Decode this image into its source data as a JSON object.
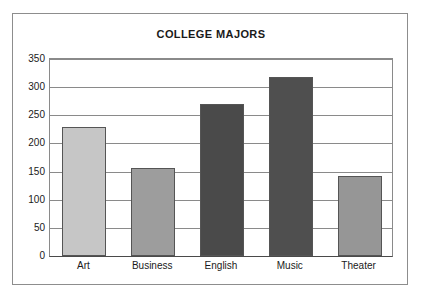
{
  "chart_data": {
    "type": "bar",
    "title": "COLLEGE MAJORS",
    "xlabel": "",
    "ylabel": "",
    "categories": [
      "Art",
      "Business",
      "English",
      "Music",
      "Theater"
    ],
    "values": [
      230,
      156,
      270,
      318,
      143
    ],
    "ylim": [
      0,
      350
    ],
    "yticks": [
      0,
      50,
      100,
      150,
      200,
      250,
      300,
      350
    ],
    "ytick_labels": [
      "0",
      "50",
      "100",
      "150",
      "200",
      "250",
      "300",
      "350"
    ],
    "grid": true,
    "legend": false,
    "bar_colors": [
      "#c6c6c6",
      "#9d9d9d",
      "#4a4a4a",
      "#4f4f4f",
      "#969696"
    ],
    "bar_border_color": "#555555",
    "axis_color": "#8a8a8a",
    "frame_color": "#8d8d8d",
    "background_color": "#ffffff",
    "text_color": "#1a1a1a"
  }
}
